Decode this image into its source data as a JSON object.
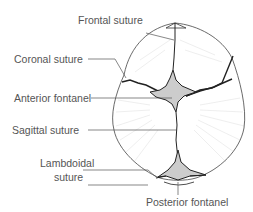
{
  "diagram": {
    "labels": {
      "frontal_suture": "Frontal suture",
      "coronal_suture": "Coronal suture",
      "anterior_fontanel": "Anterior fontanel",
      "sagittal_suture": "Sagittal suture",
      "lambdoidal_suture_line1": "Lambdoidal",
      "lambdoidal_suture_line2": "suture",
      "posterior_fontanel": "Posterior fontanel"
    },
    "colors": {
      "outline": "#333333",
      "fontanel_fill": "#cccccc",
      "leader_line": "#555555",
      "radial_texture": "#dddddd",
      "text": "#555555"
    }
  }
}
